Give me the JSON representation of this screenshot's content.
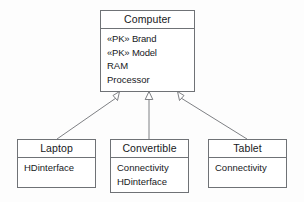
{
  "diagram": {
    "kind": "uml-class-diagram",
    "relationship": "generalization",
    "ink_color": "#6f7276",
    "text_color": "#17191c",
    "background_color": "#fdfdfd"
  },
  "classes": {
    "computer": {
      "name": "Computer",
      "attributes": [
        {
          "stereotype": "«PK»",
          "name": "Brand",
          "full": "«PK» Brand"
        },
        {
          "stereotype": "«PK»",
          "name": "Model",
          "full": "«PK» Model"
        },
        {
          "stereotype": "",
          "name": "RAM",
          "full": "RAM"
        },
        {
          "stereotype": "",
          "name": "Processor",
          "full": "Processor"
        }
      ]
    },
    "laptop": {
      "name": "Laptop",
      "attributes": [
        {
          "stereotype": "",
          "name": "HDinterface",
          "full": "HDinterface"
        }
      ]
    },
    "convertible": {
      "name": "Convertible",
      "attributes": [
        {
          "stereotype": "",
          "name": "Connectivity",
          "full": "Connectivity"
        },
        {
          "stereotype": "",
          "name": "HDinterface",
          "full": "HDinterface"
        }
      ]
    },
    "tablet": {
      "name": "Tablet",
      "attributes": [
        {
          "stereotype": "",
          "name": "Connectivity",
          "full": "Connectivity"
        }
      ]
    }
  },
  "edges": [
    {
      "from": "Laptop",
      "to": "Computer",
      "type": "generalization"
    },
    {
      "from": "Convertible",
      "to": "Computer",
      "type": "generalization"
    },
    {
      "from": "Tablet",
      "to": "Computer",
      "type": "generalization"
    }
  ]
}
